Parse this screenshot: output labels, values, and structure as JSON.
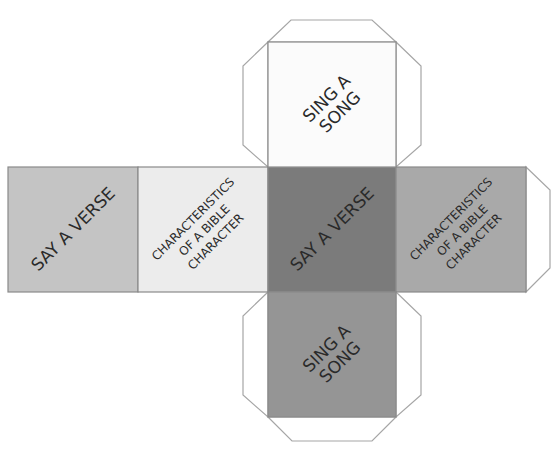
{
  "diagram": {
    "type": "cube-net",
    "colors": {
      "outline": "#9a9a9a",
      "tab_fill": "#ffffff",
      "text": "#2a2a2a"
    },
    "faces": [
      {
        "id": "left",
        "lines": [
          "SAY A VERSE"
        ],
        "fill": "#c4c4c4"
      },
      {
        "id": "left-center",
        "lines": [
          "CHARACTERISTICS",
          "OF A BIBLE",
          "CHARACTER"
        ],
        "fill": "#ececec"
      },
      {
        "id": "center",
        "lines": [
          "SAY A VERSE"
        ],
        "fill": "#7b7b7b"
      },
      {
        "id": "right",
        "lines": [
          "CHARACTERISTICS",
          "OF A BIBLE",
          "CHARACTER"
        ],
        "fill": "#a9a9a9"
      },
      {
        "id": "top",
        "lines": [
          "SING A",
          "SONG"
        ],
        "fill": "#fbfbfb"
      },
      {
        "id": "bottom",
        "lines": [
          "SING A",
          "SONG"
        ],
        "fill": "#959595"
      }
    ]
  }
}
